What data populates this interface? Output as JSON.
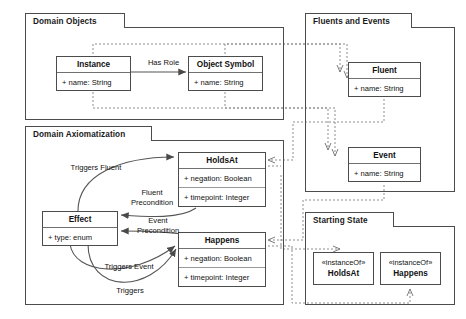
{
  "diagram": {
    "packages": [
      {
        "id": "domain-objects",
        "label": "Domain Objects"
      },
      {
        "id": "fluents-and-events",
        "label": "Fluents and Events"
      },
      {
        "id": "domain-axiomatization",
        "label": "Domain Axiomatization"
      },
      {
        "id": "starting-state",
        "label": "Starting State"
      }
    ],
    "classes": [
      {
        "id": "instance",
        "name": "Instance",
        "attributes": [
          "+ name: String"
        ]
      },
      {
        "id": "object-symbol",
        "name": "Object Symbol",
        "attributes": [
          "+ name: String"
        ]
      },
      {
        "id": "fluent",
        "name": "Fluent",
        "attributes": [
          "+ name: String"
        ]
      },
      {
        "id": "event",
        "name": "Event",
        "attributes": [
          "+ name: String"
        ]
      },
      {
        "id": "holdsat",
        "name": "HoldsAt",
        "attributes": [
          "+ negation: Boolean",
          "+ timepoint: Integer"
        ]
      },
      {
        "id": "happens",
        "name": "Happens",
        "attributes": [
          "+ negation: Boolean",
          "+ timepoint: Integer"
        ]
      },
      {
        "id": "effect",
        "name": "Effect",
        "attributes": [
          "+ type: enum"
        ]
      }
    ],
    "objects": [
      {
        "id": "instanceof-holdsat",
        "stereotype": "«instanceOf»",
        "name": "HoldsAt"
      },
      {
        "id": "instanceof-happens",
        "stereotype": "«instanceOf»",
        "name": "Happens"
      }
    ],
    "edge_labels": [
      {
        "id": "has-role",
        "text": "Has Role"
      },
      {
        "id": "triggers-fluent",
        "text": "Triggers Fluent"
      },
      {
        "id": "fluent-precondition",
        "text": "Fluent\nPrecondition"
      },
      {
        "id": "event-precondition",
        "text": "Event\nPrecondition"
      },
      {
        "id": "triggers-event",
        "text": "Triggers Event"
      },
      {
        "id": "triggers",
        "text": "Triggers"
      }
    ],
    "colors": {
      "border": "#4c4c4c",
      "divider": "#9a9a9a",
      "solid_edge": "#555555",
      "dashed_edge": "#8a8a8a",
      "text": "#111111",
      "background": "#ffffff"
    }
  }
}
